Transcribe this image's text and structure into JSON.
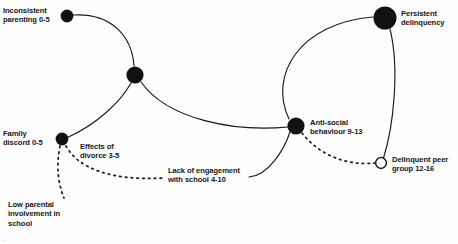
{
  "diagram": {
    "type": "causal-pathway-graph",
    "background_color": "#fefefe",
    "stroke_color": "#1a1a1a",
    "node_fill_color": "#111111",
    "hollow_node_fill_color": "#ffffff",
    "text_color": "#16171a",
    "nodes": [
      {
        "id": "inconsistent-parenting",
        "label": "Inconsistent\nparenting 0-5",
        "style": "filled",
        "x": 67,
        "y": 16,
        "r": 6.4,
        "label_side": "left",
        "label_x": 3,
        "label_y": 6
      },
      {
        "id": "junction-central",
        "label": "",
        "style": "filled",
        "x": 135,
        "y": 75,
        "r": 8.6,
        "label_side": "none",
        "label_x": 0,
        "label_y": 0
      },
      {
        "id": "persistent-delinquency",
        "label": "Persistent\ndelinquency",
        "style": "filled",
        "x": 385,
        "y": 18,
        "r": 11.5,
        "label_side": "right",
        "label_x": 401,
        "label_y": 9
      },
      {
        "id": "family-discord",
        "label": "Family\ndiscord 0-5",
        "style": "filled",
        "x": 62,
        "y": 139,
        "r": 6.4,
        "label_side": "left",
        "label_x": 3,
        "label_y": 129
      },
      {
        "id": "anti-social-behaviour",
        "label": "Anti-social\nbehaviour 9-13",
        "style": "filled",
        "x": 296,
        "y": 126,
        "r": 8.6,
        "label_side": "right",
        "label_x": 310,
        "label_y": 118
      },
      {
        "id": "delinquent-peer-group",
        "label": "Delinquent peer\ngroup 12-16",
        "style": "hollow",
        "x": 381,
        "y": 163,
        "r": 5.4,
        "label_side": "right",
        "label_x": 392,
        "label_y": 155
      }
    ],
    "floating_labels": [
      {
        "id": "effects-of-divorce",
        "label": "Effects of\ndivorce 3-5",
        "x": 80,
        "y": 142
      },
      {
        "id": "lack-of-engagement",
        "label": "Lack of engagement\nwith school 4-10",
        "x": 168,
        "y": 166
      },
      {
        "id": "low-parental-involvement",
        "label": "Low parental\ninvolvement in\nschool",
        "x": 8,
        "y": 200
      }
    ],
    "edges": [
      {
        "id": "edge-inconsistent-to-junction",
        "from": "inconsistent-parenting",
        "to": "junction-central",
        "style": "solid",
        "path": "M 73.5 15 C 110 13 132 35 134 66"
      },
      {
        "id": "edge-junction-to-family-discord",
        "from": "junction-central",
        "to": "family-discord",
        "style": "solid",
        "path": "M 131 83 C 120 103 95 125 68.5 137"
      },
      {
        "id": "edge-junction-to-antisocial",
        "from": "junction-central",
        "to": "anti-social-behaviour",
        "style": "solid",
        "path": "M 141 82 C 168 120 235 132 288 127"
      },
      {
        "id": "edge-antisocial-to-persistent",
        "from": "anti-social-behaviour",
        "to": "persistent-delinquency",
        "style": "solid",
        "path": "M 289 119 C 268 75 300 23 373 17"
      },
      {
        "id": "edge-persistent-to-peergroup",
        "from": "persistent-delinquency",
        "to": "delinquent-peer-group",
        "style": "solid",
        "path": "M 390 29 C 400 70 393 128 383.5 158"
      },
      {
        "id": "edge-school-to-antisocial",
        "from": "lack-of-engagement",
        "to": "anti-social-behaviour",
        "style": "solid",
        "path": "M 249 177 C 268 176 284 150 290 132"
      },
      {
        "id": "edge-family-discord-to-school",
        "from": "family-discord",
        "to": "lack-of-engagement",
        "style": "dashed",
        "path": "M 66 146 C 78 168 110 181 164 178"
      },
      {
        "id": "edge-family-discord-to-low-involvement",
        "from": "family-discord",
        "to": "low-parental-involvement",
        "style": "dashed",
        "path": "M 60 146 C 56 167 58 183 64 198"
      },
      {
        "id": "edge-antisocial-to-peergroup",
        "from": "anti-social-behaviour",
        "to": "delinquent-peer-group",
        "style": "dashed",
        "path": "M 302 133 C 320 156 348 166 375 163"
      }
    ],
    "corner_artifact": "..."
  }
}
